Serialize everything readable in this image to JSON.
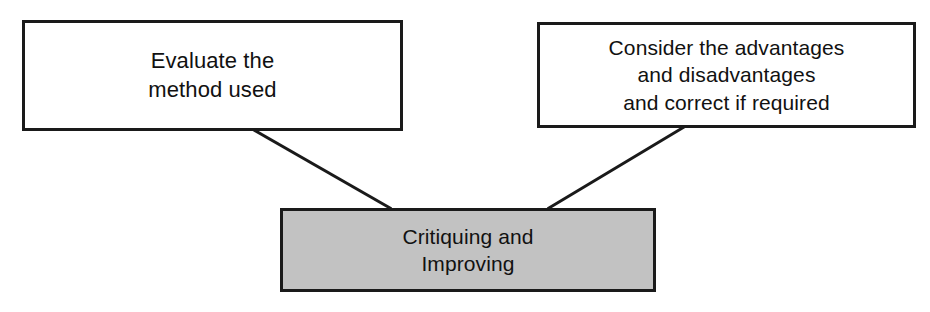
{
  "diagram": {
    "type": "concept-map",
    "background_color": "#ffffff",
    "line_color": "#1a1a1a",
    "nodes": [
      {
        "id": "evaluate-method",
        "text": "Evaluate the\nmethod used",
        "role": "supporting-idea",
        "fill_color": "#ffffff",
        "border_color": "#1a1a1a",
        "text_color": "#111111"
      },
      {
        "id": "consider-advantages",
        "text": "Consider the advantages\nand disadvantages\nand correct if required",
        "role": "supporting-idea",
        "fill_color": "#ffffff",
        "border_color": "#1a1a1a",
        "text_color": "#111111"
      },
      {
        "id": "critiquing-improving",
        "text": "Critiquing and\nImproving",
        "role": "central-topic",
        "fill_color": "#c2c2c2",
        "border_color": "#1a1a1a",
        "text_color": "#111111"
      }
    ],
    "connectors": [
      {
        "id": "connector-left",
        "from": "evaluate-method",
        "to": "critiquing-improving",
        "style": "straight-line",
        "arrowhead": "none"
      },
      {
        "id": "connector-right",
        "from": "consider-advantages",
        "to": "critiquing-improving",
        "style": "straight-line",
        "arrowhead": "none"
      }
    ]
  }
}
